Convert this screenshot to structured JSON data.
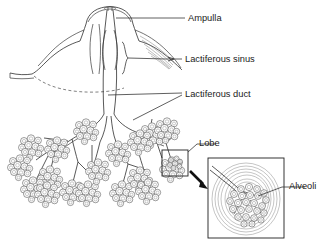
{
  "figure": {
    "background_color": "#ffffff",
    "line_color": "#2e2e2e",
    "text_color": "#1b1b1b"
  },
  "labels": {
    "ampulla": "Ampulla",
    "lactiferous_sinus": "Lactiferous sinus",
    "lactiferous_duct": "Lactiferous duct",
    "lobe": "Lobe",
    "alveoli": "Alveoli"
  },
  "structures": {
    "nipple": "nipple-cross-section",
    "areola": "areola-dashed-outline",
    "duct_trunk": "main-lactiferous-duct",
    "lobule_clusters": "grape-like-alveolar-clusters",
    "callout_box": "lobe-selection-box",
    "magnified_inset": "magnified-lobe-inset",
    "zoom_arrow": "magnification-arrow"
  }
}
